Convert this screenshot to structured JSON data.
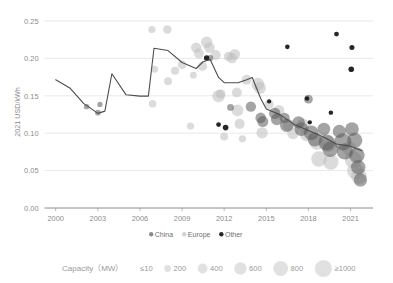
{
  "chart_data": {
    "type": "scatter",
    "title": "",
    "xlabel": "",
    "ylabel": "2021 USD/kWh",
    "xlim": [
      1999.2,
      2022.6
    ],
    "ylim": [
      0.0,
      0.25
    ],
    "grid": true,
    "x_ticks": [
      "2000",
      "2003",
      "2006",
      "2009",
      "2012",
      "2015",
      "2018",
      "2021"
    ],
    "x_tick_values": [
      2000,
      2003,
      2006,
      2009,
      2012,
      2015,
      2018,
      2021
    ],
    "y_ticks": [
      "0.00",
      "0.05",
      "0.10",
      "0.15",
      "0.20",
      "0.25"
    ],
    "y_tick_values": [
      0.0,
      0.05,
      0.1,
      0.15,
      0.2,
      0.25
    ],
    "legend_position": "bottom",
    "series": [
      {
        "name": "China",
        "color": "#5a5a5a",
        "points": [
          {
            "x": 2012.45,
            "y": 0.1345,
            "cap": 60
          },
          {
            "x": 2011.0,
            "y": 0.2005,
            "cap": 45
          },
          {
            "x": 2013.9,
            "y": 0.1355,
            "cap": 180
          },
          {
            "x": 2014.6,
            "y": 0.1205,
            "cap": 190
          },
          {
            "x": 2014.75,
            "y": 0.1155,
            "cap": 210
          },
          {
            "x": 2015.6,
            "y": 0.1265,
            "cap": 230
          },
          {
            "x": 2015.75,
            "y": 0.1185,
            "cap": 250
          },
          {
            "x": 2016.3,
            "y": 0.1205,
            "cap": 180
          },
          {
            "x": 2016.45,
            "y": 0.1105,
            "cap": 330
          },
          {
            "x": 2017.3,
            "y": 0.1145,
            "cap": 280
          },
          {
            "x": 2017.5,
            "y": 0.1055,
            "cap": 350
          },
          {
            "x": 2018.0,
            "y": 0.1455,
            "cap": 120
          },
          {
            "x": 2018.2,
            "y": 0.1005,
            "cap": 420
          },
          {
            "x": 2018.45,
            "y": 0.0915,
            "cap": 380
          },
          {
            "x": 2019.1,
            "y": 0.1055,
            "cap": 300
          },
          {
            "x": 2019.3,
            "y": 0.0875,
            "cap": 520
          },
          {
            "x": 2019.55,
            "y": 0.0785,
            "cap": 480
          },
          {
            "x": 2020.2,
            "y": 0.1025,
            "cap": 320
          },
          {
            "x": 2020.45,
            "y": 0.0885,
            "cap": 600
          },
          {
            "x": 2020.6,
            "y": 0.0755,
            "cap": 520
          },
          {
            "x": 2021.1,
            "y": 0.1055,
            "cap": 360
          },
          {
            "x": 2021.3,
            "y": 0.0905,
            "cap": 450
          },
          {
            "x": 2021.45,
            "y": 0.0705,
            "cap": 480
          },
          {
            "x": 2021.55,
            "y": 0.0545,
            "cap": 400
          },
          {
            "x": 2021.7,
            "y": 0.0375,
            "cap": 330
          },
          {
            "x": 2002.2,
            "y": 0.1355,
            "cap": 30
          },
          {
            "x": 2003.0,
            "y": 0.1275,
            "cap": 35
          },
          {
            "x": 2003.15,
            "y": 0.1385,
            "cap": 28
          }
        ]
      },
      {
        "name": "Europe",
        "color": "#bdbdbd",
        "points": [
          {
            "x": 2006.9,
            "y": 0.1395,
            "cap": 80
          },
          {
            "x": 2007.05,
            "y": 0.1855,
            "cap": 60
          },
          {
            "x": 2006.85,
            "y": 0.2385,
            "cap": 70
          },
          {
            "x": 2007.95,
            "y": 0.2385,
            "cap": 110
          },
          {
            "x": 2008.0,
            "y": 0.1695,
            "cap": 90
          },
          {
            "x": 2008.5,
            "y": 0.1835,
            "cap": 100
          },
          {
            "x": 2009.0,
            "y": 0.1915,
            "cap": 120
          },
          {
            "x": 2009.6,
            "y": 0.1095,
            "cap": 70
          },
          {
            "x": 2009.8,
            "y": 0.1775,
            "cap": 60
          },
          {
            "x": 2010.0,
            "y": 0.2145,
            "cap": 180
          },
          {
            "x": 2010.2,
            "y": 0.2065,
            "cap": 160
          },
          {
            "x": 2010.45,
            "y": 0.1895,
            "cap": 140
          },
          {
            "x": 2010.75,
            "y": 0.2215,
            "cap": 230
          },
          {
            "x": 2010.95,
            "y": 0.2145,
            "cap": 200
          },
          {
            "x": 2011.4,
            "y": 0.2045,
            "cap": 170
          },
          {
            "x": 2011.6,
            "y": 0.1495,
            "cap": 280
          },
          {
            "x": 2011.75,
            "y": 0.1525,
            "cap": 150
          },
          {
            "x": 2012.0,
            "y": 0.0955,
            "cap": 90
          },
          {
            "x": 2012.3,
            "y": 0.2025,
            "cap": 140
          },
          {
            "x": 2012.55,
            "y": 0.2005,
            "cap": 180
          },
          {
            "x": 2012.75,
            "y": 0.2055,
            "cap": 200
          },
          {
            "x": 2012.9,
            "y": 0.1545,
            "cap": 160
          },
          {
            "x": 2012.95,
            "y": 0.1305,
            "cap": 250
          },
          {
            "x": 2013.1,
            "y": 0.1125,
            "cap": 170
          },
          {
            "x": 2013.3,
            "y": 0.0925,
            "cap": 70
          },
          {
            "x": 2013.6,
            "y": 0.1715,
            "cap": 160
          },
          {
            "x": 2014.4,
            "y": 0.1655,
            "cap": 300
          },
          {
            "x": 2014.55,
            "y": 0.1605,
            "cap": 260
          },
          {
            "x": 2014.7,
            "y": 0.1005,
            "cap": 230
          },
          {
            "x": 2015.2,
            "y": 0.1385,
            "cap": 140
          },
          {
            "x": 2015.9,
            "y": 0.1305,
            "cap": 200
          },
          {
            "x": 2016.6,
            "y": 0.1105,
            "cap": 280
          },
          {
            "x": 2016.9,
            "y": 0.0995,
            "cap": 230
          },
          {
            "x": 2017.6,
            "y": 0.1105,
            "cap": 320
          },
          {
            "x": 2017.85,
            "y": 0.0975,
            "cap": 280
          },
          {
            "x": 2018.6,
            "y": 0.0875,
            "cap": 420
          },
          {
            "x": 2018.75,
            "y": 0.0655,
            "cap": 480
          },
          {
            "x": 2019.4,
            "y": 0.0855,
            "cap": 520
          },
          {
            "x": 2019.6,
            "y": 0.0615,
            "cap": 460
          },
          {
            "x": 2020.9,
            "y": 0.0795,
            "cap": 380
          },
          {
            "x": 2021.2,
            "y": 0.0645,
            "cap": 600
          },
          {
            "x": 2021.35,
            "y": 0.0495,
            "cap": 560
          },
          {
            "x": 2021.6,
            "y": 0.0425,
            "cap": 500
          }
        ]
      },
      {
        "name": "Other",
        "color": "#1a1a1a",
        "points": [
          {
            "x": 2012.1,
            "y": 0.1075,
            "cap": 35
          },
          {
            "x": 2011.6,
            "y": 0.1115,
            "cap": 20
          },
          {
            "x": 2010.75,
            "y": 0.2005,
            "cap": 30
          },
          {
            "x": 2016.5,
            "y": 0.2155,
            "cap": 18
          },
          {
            "x": 2017.9,
            "y": 0.1465,
            "cap": 16
          },
          {
            "x": 2020.0,
            "y": 0.2325,
            "cap": 20
          },
          {
            "x": 2021.1,
            "y": 0.2145,
            "cap": 24
          },
          {
            "x": 2021.05,
            "y": 0.1855,
            "cap": 34
          },
          {
            "x": 2019.6,
            "y": 0.1275,
            "cap": 16
          },
          {
            "x": 2015.2,
            "y": 0.1425,
            "cap": 14
          },
          {
            "x": 2018.1,
            "y": 0.1145,
            "cap": 14
          }
        ]
      }
    ],
    "trendline": {
      "name": "Weighted average",
      "color": "#4d4d4d",
      "points": [
        {
          "x": 2000.0,
          "y": 0.1715
        },
        {
          "x": 2001.0,
          "y": 0.1605
        },
        {
          "x": 2002.0,
          "y": 0.1395
        },
        {
          "x": 2002.4,
          "y": 0.1345
        },
        {
          "x": 2003.0,
          "y": 0.1265
        },
        {
          "x": 2003.5,
          "y": 0.1295
        },
        {
          "x": 2004.0,
          "y": 0.1795
        },
        {
          "x": 2005.0,
          "y": 0.1515
        },
        {
          "x": 2006.0,
          "y": 0.1495
        },
        {
          "x": 2006.6,
          "y": 0.1495
        },
        {
          "x": 2007.0,
          "y": 0.2135
        },
        {
          "x": 2008.0,
          "y": 0.2105
        },
        {
          "x": 2009.0,
          "y": 0.1945
        },
        {
          "x": 2010.0,
          "y": 0.1865
        },
        {
          "x": 2010.5,
          "y": 0.1955
        },
        {
          "x": 2011.0,
          "y": 0.1985
        },
        {
          "x": 2011.6,
          "y": 0.1745
        },
        {
          "x": 2012.0,
          "y": 0.1675
        },
        {
          "x": 2013.0,
          "y": 0.1675
        },
        {
          "x": 2013.6,
          "y": 0.1715
        },
        {
          "x": 2014.0,
          "y": 0.1745
        },
        {
          "x": 2014.6,
          "y": 0.1465
        },
        {
          "x": 2015.0,
          "y": 0.1325
        },
        {
          "x": 2016.0,
          "y": 0.1245
        },
        {
          "x": 2017.0,
          "y": 0.1115
        },
        {
          "x": 2018.0,
          "y": 0.1035
        },
        {
          "x": 2019.0,
          "y": 0.0955
        },
        {
          "x": 2020.0,
          "y": 0.0855
        },
        {
          "x": 2021.0,
          "y": 0.0825
        },
        {
          "x": 2021.8,
          "y": 0.0765
        }
      ]
    }
  },
  "legend": {
    "series_items": [
      {
        "label": "China",
        "color": "#5a5a5a"
      },
      {
        "label": "Europe",
        "color": "#bdbdbd"
      },
      {
        "label": "Other",
        "color": "#1a1a1a"
      }
    ],
    "size_legend": {
      "title": "Capacity（MW）",
      "items": [
        {
          "label": "≤10",
          "r": 1.2
        },
        {
          "label": "200",
          "r": 3.4
        },
        {
          "label": "400",
          "r": 4.9
        },
        {
          "label": "600",
          "r": 6.2
        },
        {
          "label": "800",
          "r": 7.4
        },
        {
          "label": "≥1000",
          "r": 8.6
        }
      ]
    }
  }
}
